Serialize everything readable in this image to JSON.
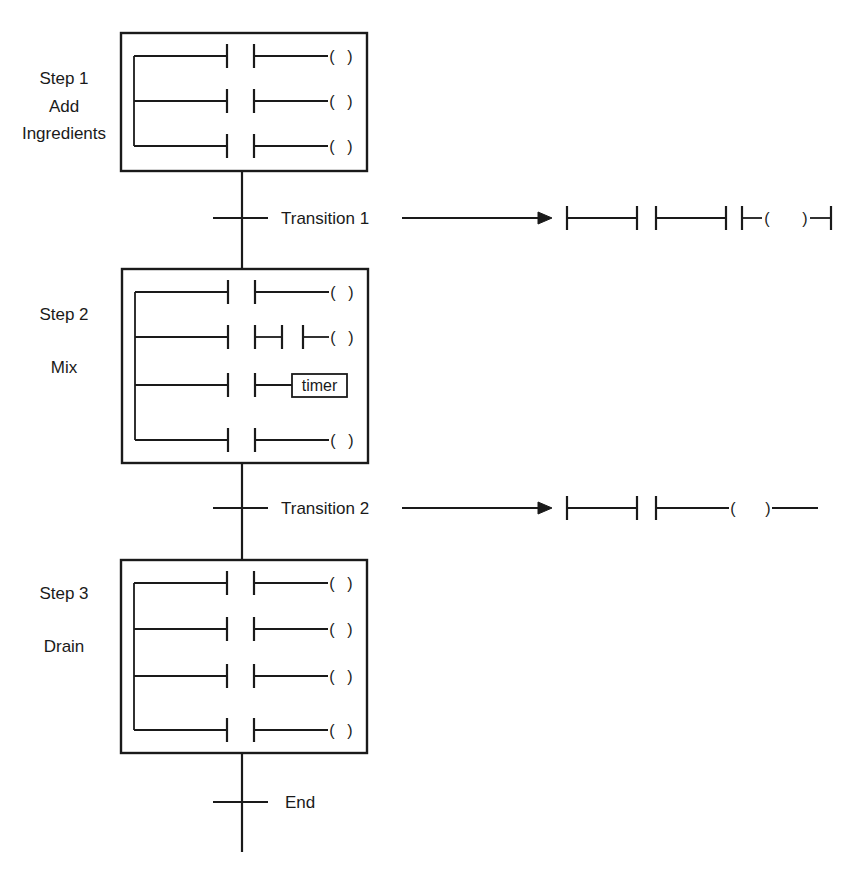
{
  "diagram": {
    "colors": {
      "ink": "#1a1a1a",
      "background": "#ffffff"
    },
    "spine_x": 242,
    "steps": [
      {
        "id": "step1",
        "labels": [
          "Step 1",
          "Add",
          "Ingredients"
        ],
        "label_y": [
          78,
          106,
          133
        ],
        "box": {
          "x": 121,
          "y": 33,
          "w": 246,
          "h": 138
        },
        "rungs": [
          {
            "y": 56,
            "type": "coil"
          },
          {
            "y": 101,
            "type": "coil"
          },
          {
            "y": 146,
            "type": "coil"
          }
        ]
      },
      {
        "id": "step2",
        "labels": [
          "Step 2",
          "Mix"
        ],
        "label_y": [
          314,
          367
        ],
        "box": {
          "x": 122,
          "y": 269,
          "w": 246,
          "h": 194
        },
        "rungs": [
          {
            "y": 292,
            "type": "coil"
          },
          {
            "y": 337,
            "type": "coil-extra-contact"
          },
          {
            "y": 385,
            "type": "timer",
            "block_label": "timer"
          },
          {
            "y": 440,
            "type": "coil"
          }
        ]
      },
      {
        "id": "step3",
        "labels": [
          "Step 3",
          "Drain"
        ],
        "label_y": [
          593,
          646
        ],
        "box": {
          "x": 121,
          "y": 560,
          "w": 246,
          "h": 193
        },
        "rungs": [
          {
            "y": 583,
            "type": "coil"
          },
          {
            "y": 629,
            "type": "coil"
          },
          {
            "y": 676,
            "type": "coil"
          },
          {
            "y": 730,
            "type": "coil"
          }
        ]
      }
    ],
    "transitions": [
      {
        "id": "transition1",
        "label": "Transition 1",
        "y": 218,
        "arrow": {
          "x1": 402,
          "x2": 552
        },
        "ladder": "two-contacts-coil-closed"
      },
      {
        "id": "transition2",
        "label": "Transition 2",
        "y": 508,
        "arrow": {
          "x1": 402,
          "x2": 552
        },
        "ladder": "two-contacts-coil-open"
      }
    ],
    "end": {
      "label": "End",
      "y": 802
    },
    "coil_symbol": {
      "open": "(",
      "close": ")"
    }
  }
}
